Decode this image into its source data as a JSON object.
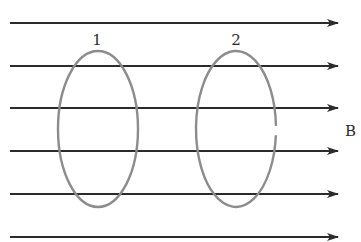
{
  "diagram": {
    "field": {
      "label": "B",
      "direction": "right",
      "line_count": 6,
      "line_y": [
        23,
        66,
        108,
        151,
        194,
        237
      ],
      "line_x_start": 10,
      "line_x_end": 338,
      "color": "#2b2b2b"
    },
    "loops": [
      {
        "label": "1",
        "cx": 98,
        "cy": 129,
        "rx": 40,
        "ry": 78,
        "closed": true,
        "color": "#8c8c8c"
      },
      {
        "label": "2",
        "cx": 236,
        "cy": 129,
        "rx": 40,
        "ry": 78,
        "closed": false,
        "gap_side": "right",
        "color": "#8c8c8c"
      }
    ]
  }
}
